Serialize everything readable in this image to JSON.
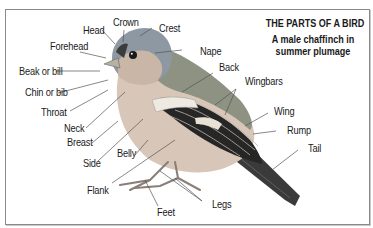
{
  "diagram": {
    "title": "THE PARTS OF A BIRD",
    "subtitle_line1": "A male chaffinch in",
    "subtitle_line2": "summer plumage",
    "subject": "male chaffinch",
    "labels": {
      "head": "Head",
      "crown": "Crown",
      "crest": "Crest",
      "forehead": "Forehead",
      "nape": "Nape",
      "back": "Back",
      "beak": "Beak or bill",
      "chin": "Chin or bib",
      "wingbars": "Wingbars",
      "throat": "Throat",
      "wing": "Wing",
      "neck": "Neck",
      "rump": "Rump",
      "breast": "Breast",
      "tail": "Tail",
      "side": "Side",
      "belly": "Belly",
      "flank": "Flank",
      "legs": "Legs",
      "feet": "Feet"
    },
    "colors": {
      "head_grey": "#8c96a0",
      "cheek": "#c8b8a8",
      "breast": "#d4c2b4",
      "back": "#8a8e7e",
      "wing_dark": "#2a2a2a",
      "wingbar": "#e8e4dc",
      "leader_line": "#555555",
      "border": "#8a8a8a"
    }
  }
}
